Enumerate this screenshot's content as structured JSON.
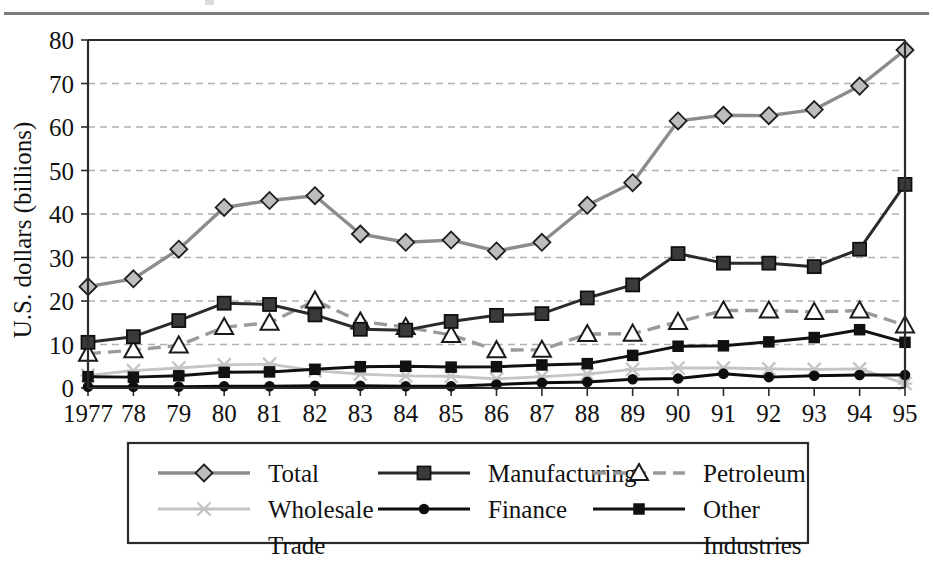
{
  "chart_data": {
    "type": "line",
    "title": "",
    "xlabel": "",
    "ylabel": "U.S. dollars (billions)",
    "ylim": [
      0,
      80
    ],
    "yticks": [
      0,
      10,
      20,
      30,
      40,
      50,
      60,
      70,
      80
    ],
    "grid": true,
    "grid_style": "dotted-horizontal",
    "legend_position": "bottom",
    "categories": [
      "1977",
      "78",
      "79",
      "80",
      "81",
      "82",
      "83",
      "84",
      "85",
      "86",
      "87",
      "88",
      "89",
      "90",
      "91",
      "92",
      "93",
      "94",
      "95"
    ],
    "x": [
      1977,
      1978,
      1979,
      1980,
      1981,
      1982,
      1983,
      1984,
      1985,
      1986,
      1987,
      1988,
      1989,
      1990,
      1991,
      1992,
      1993,
      1994,
      1995
    ],
    "series": [
      {
        "name": "Total",
        "marker": "diamond",
        "color": "#8c8c8c",
        "line_style": "solid",
        "values": [
          23.3,
          25.1,
          31.9,
          41.5,
          43.1,
          44.2,
          35.4,
          33.5,
          34.0,
          31.5,
          33.5,
          42.0,
          47.2,
          61.4,
          62.7,
          62.6,
          64.0,
          69.4,
          77.7
        ]
      },
      {
        "name": "Manufacturing",
        "marker": "square",
        "color": "#2b2b2b",
        "line_style": "solid",
        "values": [
          10.5,
          11.8,
          15.5,
          19.5,
          19.2,
          16.8,
          13.5,
          13.3,
          15.3,
          16.7,
          17.1,
          20.7,
          23.7,
          30.9,
          28.7,
          28.7,
          27.9,
          31.9,
          46.8
        ]
      },
      {
        "name": "Petroleum",
        "marker": "triangle",
        "color": "#9a9a9a",
        "line_style": "dashed",
        "values": [
          7.9,
          8.7,
          9.8,
          14.0,
          15.0,
          20.1,
          15.3,
          14.0,
          12.2,
          8.7,
          8.8,
          12.4,
          12.5,
          15.2,
          17.8,
          17.8,
          17.5,
          17.8,
          14.4
        ]
      },
      {
        "name": "Wholesale Trade",
        "marker": "x",
        "color": "#c5c5c5",
        "line_style": "solid",
        "values": [
          2.9,
          4.0,
          4.6,
          5.3,
          5.5,
          4.0,
          3.2,
          2.8,
          2.7,
          2.1,
          2.6,
          3.2,
          4.3,
          4.6,
          4.6,
          4.4,
          4.3,
          4.4,
          1.0
        ]
      },
      {
        "name": "Finance",
        "marker": "circle",
        "color": "#0d0d0d",
        "line_style": "solid",
        "values": [
          0.3,
          0.3,
          0.3,
          0.4,
          0.4,
          0.5,
          0.5,
          0.4,
          0.4,
          0.8,
          1.2,
          1.4,
          2.0,
          2.2,
          3.3,
          2.5,
          2.8,
          3.0,
          3.0
        ]
      },
      {
        "name": "Other Industries",
        "marker": "small-square",
        "color": "#111111",
        "line_style": "solid",
        "values": [
          2.6,
          2.5,
          2.8,
          3.6,
          3.7,
          4.3,
          4.9,
          5.0,
          4.8,
          4.9,
          5.3,
          5.6,
          7.5,
          9.6,
          9.7,
          10.6,
          11.6,
          13.4,
          10.5
        ]
      }
    ]
  },
  "legend": {
    "entries": [
      {
        "label": "Total"
      },
      {
        "label": "Manufacturing"
      },
      {
        "label": "Petroleum"
      },
      {
        "label": "Wholesale"
      },
      {
        "label": "Trade"
      },
      {
        "label": "Finance"
      },
      {
        "label": "Other"
      },
      {
        "label": "Industries"
      }
    ]
  },
  "colors": {
    "total": "#8c8c8c",
    "manufacturing": "#2b2b2b",
    "petroleum": "#9a9a9a",
    "wholesale_trade": "#c5c5c5",
    "finance": "#0d0d0d",
    "other_industries": "#111111",
    "axis": "#2b2b2b",
    "grid": "#b0b0b0",
    "top_rule": "#7b7b7b"
  }
}
